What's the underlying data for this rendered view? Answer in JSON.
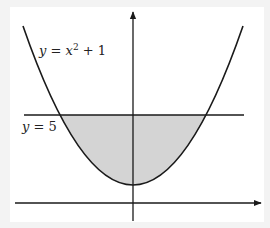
{
  "diagram": {
    "curve_label": {
      "y": "y",
      "eq": " = ",
      "x": "x",
      "exp": "2",
      "rest": " + 1"
    },
    "line_label": {
      "y": "y",
      "rest": " = 5"
    },
    "curve": {
      "equation": "y = x^2 + 1",
      "x_range": [
        -3,
        3
      ]
    },
    "line": {
      "equation": "y = 5"
    },
    "shaded_region": {
      "between": [
        "y = x^2 + 1",
        "y = 5"
      ],
      "x_range": [
        -2,
        2
      ]
    },
    "axes": {
      "x_arrow": true,
      "y_arrow": true
    },
    "colors": {
      "background": "#f3f3f3",
      "panel": "#ffffff",
      "stroke": "#1a1a1a",
      "fill": "#d4d4d4"
    }
  }
}
